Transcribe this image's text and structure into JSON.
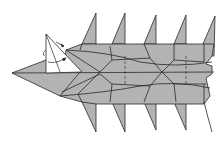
{
  "diagram": {
    "type": "origami-fold-diagram",
    "colors": {
      "paper_colored": "#b3b3b3",
      "paper_white": "#ffffff",
      "crease_line": "#2a2a2a",
      "background": "#ffffff"
    },
    "annotations": {
      "fold_arrows": 2,
      "valley_fold_lines": 2,
      "white_flap": "triangular flap raised near head"
    },
    "step_number": ""
  }
}
